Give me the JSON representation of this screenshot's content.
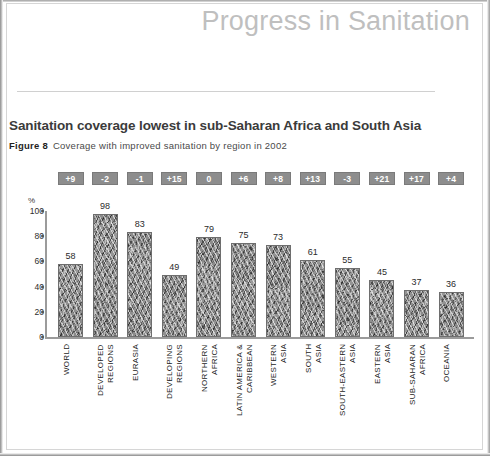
{
  "header": {
    "title": "Progress in Sanitation"
  },
  "figure": {
    "chart_title": "Sanitation coverage lowest in sub-Saharan Africa and South Asia",
    "figure_label": "Figure 8",
    "figure_text": "Coverage with improved sanitation by region in 2002"
  },
  "axis": {
    "y_unit": "%",
    "y_ticks": [
      "100",
      "80",
      "60",
      "40",
      "20",
      "0"
    ]
  },
  "colors": {
    "header_title": "#bfbfbf",
    "badge_background": "#8d8d8d",
    "badge_text": "#ffffff",
    "bar_fill": "#8c8c8c",
    "axis": "#9b9b9b"
  },
  "chart_data": {
    "type": "bar",
    "title": "Sanitation coverage lowest in sub-Saharan Africa and South Asia",
    "subtitle": "Figure 8  Coverage with improved sanitation by region in 2002",
    "xlabel": "",
    "ylabel": "%",
    "ylim": [
      0,
      100
    ],
    "yticks": [
      0,
      20,
      40,
      60,
      80,
      100
    ],
    "grid": false,
    "legend": "none",
    "categories": [
      "WORLD",
      "DEVELOPED REGIONS",
      "EURASIA",
      "DEVELOPING REGIONS",
      "NORTHERN AFRICA",
      "LATIN AMERICA & CARIBBEAN",
      "WESTERN ASIA",
      "SOUTH ASIA",
      "SOUTH-EASTERN ASIA",
      "EASTERN ASIA",
      "SUB-SAHARAN AFRICA",
      "OCEANIA"
    ],
    "values": [
      58,
      98,
      83,
      49,
      79,
      75,
      73,
      61,
      55,
      45,
      37,
      36
    ],
    "annotations": {
      "name": "change since 1990 (percentage points)",
      "values": [
        "+9",
        "-2",
        "-1",
        "+15",
        "0",
        "+6",
        "+8",
        "+13",
        "-3",
        "+21",
        "+17",
        "+4"
      ]
    }
  }
}
